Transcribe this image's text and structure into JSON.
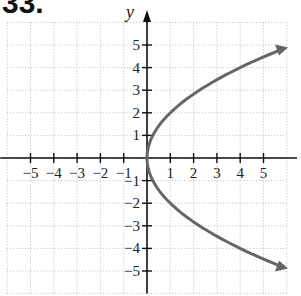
{
  "problem_number": "33.",
  "chart_data": {
    "type": "line",
    "title": "",
    "xlabel": "",
    "ylabel": "y",
    "equation": "x = y^2/4",
    "xlim": [
      -6,
      6
    ],
    "ylim": [
      -6,
      6
    ],
    "grid": true,
    "x_ticks": [
      -5,
      -4,
      -3,
      -2,
      -1,
      1,
      2,
      3,
      4,
      5
    ],
    "y_ticks": [
      -5,
      -4,
      -3,
      -2,
      -1,
      1,
      2,
      3,
      4,
      5
    ],
    "series": [
      {
        "name": "parabola",
        "color": "#666666",
        "points": [
          [
            6.0,
            4.9
          ],
          [
            4,
            4
          ],
          [
            2.25,
            3
          ],
          [
            1,
            2
          ],
          [
            0.25,
            1
          ],
          [
            0,
            0
          ],
          [
            0.25,
            -1
          ],
          [
            1,
            -2
          ],
          [
            2.25,
            -3
          ],
          [
            4,
            -4
          ],
          [
            6.0,
            -4.9
          ]
        ],
        "arrows": "both-ends"
      }
    ]
  }
}
